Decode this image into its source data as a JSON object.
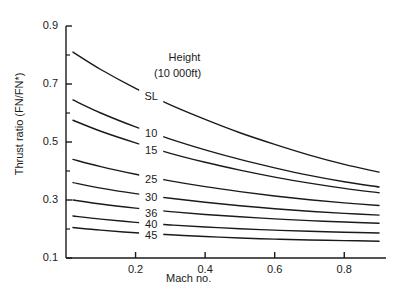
{
  "chart_data": {
    "type": "line",
    "title": "",
    "xlabel": "Mach no.",
    "ylabel": "Thrust ratio (FN/FN*)",
    "xlim": [
      0.0,
      0.92
    ],
    "ylim": [
      0.05,
      0.95
    ],
    "grid": false,
    "legend_position": "inline-curve-labels",
    "legend_title": "Height",
    "legend_subtitle": "(10 000ft)",
    "xticks": [
      0.2,
      0.4,
      0.6,
      0.8
    ],
    "xtick_labels": [
      "0.2",
      "0.4",
      "0.6",
      "0.8"
    ],
    "yticks": [
      0.1,
      0.3,
      0.5,
      0.7,
      0.9
    ],
    "ytick_labels": [
      "0.1",
      "0.3",
      "0.5",
      "0.7",
      "0.9"
    ],
    "yminor_ticks": [
      0.2,
      0.4,
      0.6,
      0.8
    ],
    "x": [
      0.02,
      0.1,
      0.2,
      0.3,
      0.4,
      0.5,
      0.6,
      0.7,
      0.8,
      0.9
    ],
    "series": [
      {
        "name": "SL",
        "label": "SL",
        "values": [
          0.81,
          0.75,
          0.685,
          0.628,
          0.578,
          0.532,
          0.492,
          0.455,
          0.423,
          0.396
        ]
      },
      {
        "name": "10",
        "label": "10",
        "values": [
          0.645,
          0.6,
          0.552,
          0.51,
          0.473,
          0.44,
          0.411,
          0.385,
          0.363,
          0.345
        ]
      },
      {
        "name": "15",
        "label": "15",
        "values": [
          0.575,
          0.537,
          0.497,
          0.461,
          0.43,
          0.403,
          0.379,
          0.358,
          0.34,
          0.325
        ]
      },
      {
        "name": "25",
        "label": "25",
        "values": [
          0.44,
          0.415,
          0.389,
          0.366,
          0.346,
          0.329,
          0.314,
          0.301,
          0.29,
          0.281
        ]
      },
      {
        "name": "30",
        "label": "30",
        "values": [
          0.36,
          0.341,
          0.322,
          0.306,
          0.292,
          0.28,
          0.27,
          0.261,
          0.254,
          0.248
        ]
      },
      {
        "name": "36",
        "label": "36",
        "values": [
          0.3,
          0.286,
          0.272,
          0.26,
          0.25,
          0.242,
          0.235,
          0.229,
          0.224,
          0.22
        ]
      },
      {
        "name": "40",
        "label": "40",
        "values": [
          0.245,
          0.234,
          0.223,
          0.214,
          0.207,
          0.201,
          0.196,
          0.192,
          0.189,
          0.186
        ]
      },
      {
        "name": "45",
        "label": "45",
        "values": [
          0.205,
          0.196,
          0.187,
          0.18,
          0.174,
          0.169,
          0.165,
          0.162,
          0.16,
          0.158
        ]
      }
    ],
    "curve_label_positions": [
      {
        "label": "SL",
        "x": 0.245,
        "y": 0.655
      },
      {
        "label": "10",
        "x": 0.245,
        "y": 0.527
      },
      {
        "label": "15",
        "x": 0.245,
        "y": 0.468
      },
      {
        "label": "25",
        "x": 0.245,
        "y": 0.368
      },
      {
        "label": "30",
        "x": 0.245,
        "y": 0.306
      },
      {
        "label": "36",
        "x": 0.245,
        "y": 0.253
      },
      {
        "label": "40",
        "x": 0.245,
        "y": 0.214
      },
      {
        "label": "45",
        "x": 0.245,
        "y": 0.176
      }
    ],
    "annotations": [
      {
        "text": "Height",
        "x": 0.335,
        "y": 0.79
      },
      {
        "text": "(10 000ft)",
        "x": 0.315,
        "y": 0.735
      }
    ],
    "colors": {
      "line": "#1a1a1a",
      "axis": "#1a1a1a",
      "background": "#ffffff"
    }
  }
}
